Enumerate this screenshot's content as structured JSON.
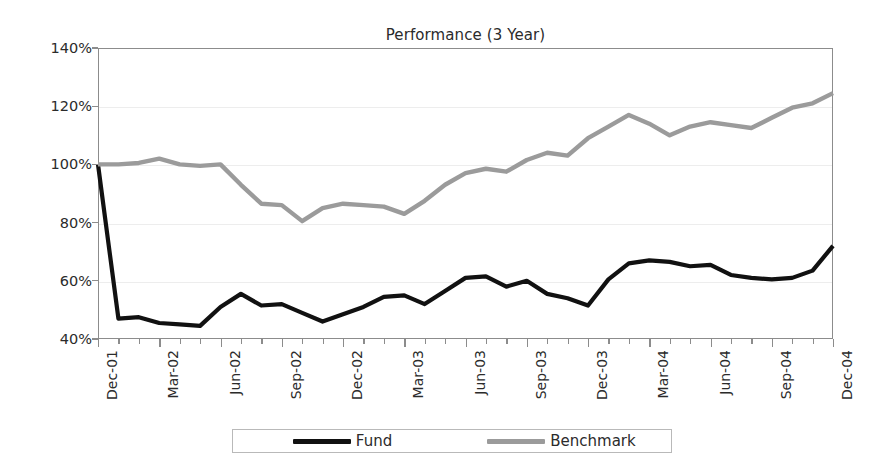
{
  "chart_data": {
    "type": "line",
    "title": "Performance (3 Year)",
    "xlabel": "",
    "ylabel": "",
    "ylim": [
      40,
      140
    ],
    "ytick_values": [
      40,
      60,
      80,
      100,
      120,
      140
    ],
    "ytick_labels": [
      "40%",
      "60%",
      "80%",
      "100%",
      "120%",
      "140%"
    ],
    "grid": true,
    "legend_position": "bottom-center",
    "x": [
      "Dec-01",
      "Jan-02",
      "Feb-02",
      "Mar-02",
      "Apr-02",
      "May-02",
      "Jun-02",
      "Jul-02",
      "Aug-02",
      "Sep-02",
      "Oct-02",
      "Nov-02",
      "Dec-02",
      "Jan-03",
      "Feb-03",
      "Mar-03",
      "Apr-03",
      "May-03",
      "Jun-03",
      "Jul-03",
      "Aug-03",
      "Sep-03",
      "Oct-03",
      "Nov-03",
      "Dec-03",
      "Jan-04",
      "Feb-04",
      "Mar-04",
      "Apr-04",
      "May-04",
      "Jun-04",
      "Jul-04",
      "Aug-04",
      "Sep-04",
      "Oct-04",
      "Nov-04",
      "Dec-04"
    ],
    "xtick_labels": [
      "Dec-01",
      "Mar-02",
      "Jun-02",
      "Sep-02",
      "Dec-02",
      "Mar-03",
      "Jun-03",
      "Sep-03",
      "Dec-03",
      "Mar-04",
      "Jun-04",
      "Sep-04",
      "Dec-04"
    ],
    "xtick_label_indices": [
      0,
      3,
      6,
      9,
      12,
      15,
      18,
      21,
      24,
      27,
      30,
      33,
      36
    ],
    "series": [
      {
        "name": "Fund",
        "color": "#111111",
        "values": [
          100.0,
          47.0,
          47.5,
          45.5,
          45.0,
          44.5,
          51.0,
          55.5,
          51.5,
          52.0,
          49.0,
          46.0,
          48.5,
          51.0,
          54.5,
          55.0,
          52.0,
          56.5,
          61.0,
          61.5,
          58.0,
          60.0,
          55.5,
          54.0,
          51.5,
          60.5,
          66.0,
          67.0,
          66.5,
          65.0,
          65.5,
          62.0,
          61.0,
          60.5,
          61.0,
          63.5,
          72.0
        ]
      },
      {
        "name": "Benchmark",
        "color": "#9b9b9b",
        "values": [
          100.0,
          100.0,
          100.5,
          102.0,
          100.0,
          99.5,
          100.0,
          93.0,
          86.5,
          86.0,
          80.5,
          85.0,
          86.5,
          86.0,
          85.5,
          83.0,
          87.5,
          93.0,
          97.0,
          98.5,
          97.5,
          101.5,
          104.0,
          103.0,
          109.0,
          113.0,
          117.0,
          114.0,
          110.0,
          113.0,
          114.5,
          113.5,
          112.5,
          116.0,
          119.5,
          121.0,
          124.5
        ]
      }
    ]
  },
  "legend": {
    "entries": [
      {
        "label": "Fund"
      },
      {
        "label": "Benchmark"
      }
    ]
  }
}
